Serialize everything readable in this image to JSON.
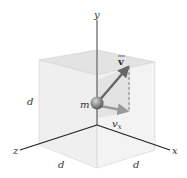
{
  "diagram": {
    "labels": {
      "y_axis": "y",
      "x_axis": "x",
      "z_axis": "z",
      "velocity": "v",
      "velocity_x": "v",
      "velocity_x_sub": "x",
      "mass": "m",
      "side_left": "d",
      "side_bottom_left": "d",
      "side_bottom_right": "d"
    },
    "colors": {
      "axis": "#222222",
      "y_axis": "#777777",
      "cube_face": "#ececec",
      "cube_top": "#e2e2e2",
      "cube_edge": "#d0d0d0",
      "sphere": "#888888",
      "vector": "#666666",
      "vx_arrow": "#999999",
      "dashed": "#777777"
    }
  }
}
